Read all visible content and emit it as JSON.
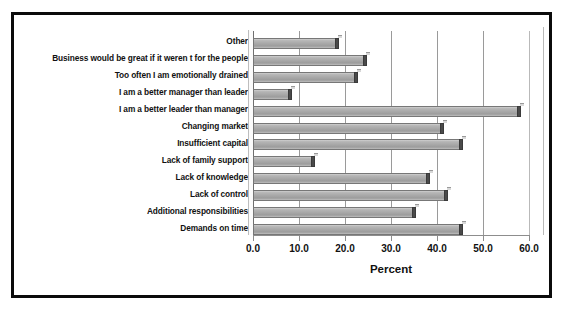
{
  "chart_data": {
    "type": "bar",
    "orientation": "horizontal",
    "title": "",
    "xlabel": "Percent",
    "ylabel": "",
    "xlim": [
      0.0,
      60.0
    ],
    "xticks": [
      "0.0",
      "10.0",
      "20.0",
      "30.0",
      "40.0",
      "50.0",
      "60.0"
    ],
    "xtick_values": [
      0,
      10,
      20,
      30,
      40,
      50,
      60
    ],
    "grid": true,
    "legend": false,
    "style": "3d-gray-bars",
    "bar_color": "#a6a6a6",
    "categories": [
      "Other",
      "Business would be great if it weren t for the people",
      "Too often I am emotionally drained",
      "I am a better manager than leader",
      "I am a better leader than manager",
      "Changing market",
      "Insufficient capital",
      "Lack of family support",
      "Lack of knowledge",
      "Lack of control",
      "Additional responsibilities",
      "Demands on time"
    ],
    "values": [
      18.8,
      24.8,
      22.8,
      8.5,
      58.2,
      41.5,
      45.6,
      13.4,
      38.5,
      42.4,
      35.4,
      45.6
    ]
  }
}
